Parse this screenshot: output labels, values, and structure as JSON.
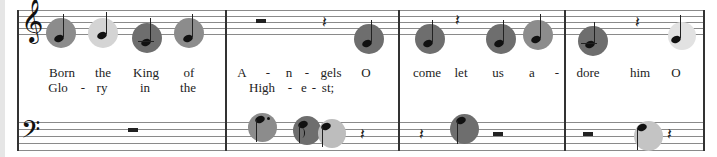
{
  "score": {
    "treble_clef_glyph": "𝄞",
    "bass_clef_glyph": "𝄢",
    "quarter_rest_glyph": "𝄽",
    "highlight_colors": {
      "dark": "#6e6e6e",
      "medium": "#8c8c8c",
      "light": "#d4d4d4"
    },
    "measures": [
      {
        "index": 1,
        "lyrics_line1": [
          "Born",
          "the",
          "King",
          "of"
        ],
        "lyrics_line2": [
          "Glo",
          "-",
          "ry",
          "in",
          "the"
        ]
      },
      {
        "index": 2,
        "lyrics_line1": [
          "A",
          "-",
          "n",
          "-",
          "gels",
          "O"
        ],
        "lyrics_line2": [
          "High",
          "-",
          "e",
          "-",
          "st;"
        ]
      },
      {
        "index": 3,
        "lyrics_line1": [
          "come",
          "let",
          "us",
          "a",
          "-"
        ],
        "lyrics_line2": []
      },
      {
        "index": 4,
        "lyrics_line1": [
          "dore",
          "him",
          "O"
        ],
        "lyrics_line2": []
      }
    ]
  }
}
